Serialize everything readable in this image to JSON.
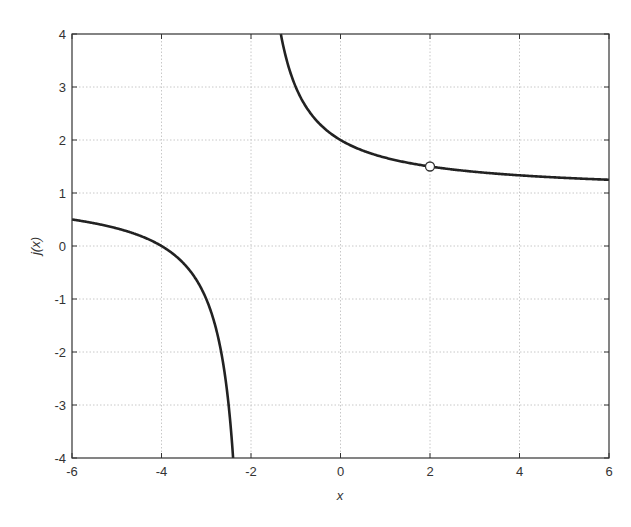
{
  "chart_data": {
    "type": "line",
    "title": "",
    "xlabel": "x",
    "ylabel": "j(x)",
    "xlim": [
      -6,
      6
    ],
    "ylim": [
      -4,
      4
    ],
    "xticks": [
      -6,
      -4,
      -2,
      0,
      2,
      4,
      6
    ],
    "yticks": [
      -4,
      -3,
      -2,
      -1,
      0,
      1,
      2,
      3,
      4
    ],
    "xtick_labels": [
      "-6",
      "-4",
      "-2",
      "0",
      "2",
      "4",
      "6"
    ],
    "ytick_labels": [
      "-4",
      "-3",
      "-2",
      "-1",
      "0",
      "1",
      "2",
      "3",
      "4"
    ],
    "grid": true,
    "legend": null,
    "function": "j(x) = (x+4)/(x+2), x ≠ 2",
    "vertical_asymptote": -2,
    "series": [
      {
        "name": "left branch",
        "x": [
          -6,
          -5,
          -4,
          -3.5,
          -3,
          -2.75,
          -2.5,
          -2.4
        ],
        "y": [
          0.5,
          0.333,
          0,
          -0.333,
          -1,
          -1.667,
          -3,
          -4
        ]
      },
      {
        "name": "right branch",
        "x": [
          -1.333,
          -1.25,
          -1,
          -0.5,
          0,
          1,
          2,
          3,
          4,
          5,
          6
        ],
        "y": [
          4,
          3.667,
          3,
          2.333,
          2,
          1.667,
          1.5,
          1.4,
          1.333,
          1.286,
          1.25
        ]
      }
    ],
    "annotations": [
      {
        "type": "open-circle",
        "x": 2,
        "y": 1.5,
        "meaning": "hole / removable discontinuity"
      }
    ],
    "colors": {
      "curve": "#222222",
      "grid": "#c8c8c8",
      "axes": "#333333",
      "marker_fill": "#ffffff"
    }
  }
}
